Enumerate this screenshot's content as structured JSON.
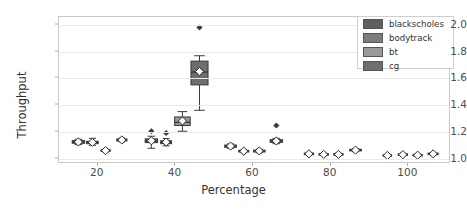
{
  "chart_data": {
    "type": "box",
    "title": "",
    "xlabel": "Percentage",
    "ylabel": "Throughput",
    "xlim": [
      10,
      111
    ],
    "ylim": [
      0.96,
      2.06
    ],
    "xticks": [
      20,
      40,
      60,
      80,
      100
    ],
    "yticks": [
      "1.0",
      "1.2",
      "1.4",
      "1.6",
      "1.8",
      "2.0"
    ],
    "ytick_values": [
      1.0,
      1.2,
      1.4,
      1.6,
      1.8,
      2.0
    ],
    "grid": "horizontal",
    "legend_position": "upper right",
    "legend": [
      {
        "name": "blackscholes",
        "color": "#5f5f5f"
      },
      {
        "name": "bodytrack",
        "color": "#7d7d7d"
      },
      {
        "name": "bt",
        "color": "#9a9a9a"
      },
      {
        "name": "cg",
        "color": "#6e6e6e"
      }
    ],
    "mean_marker": "white-diamond",
    "boxes": [
      {
        "series": "blackscholes",
        "x": 15.0,
        "width": 3.2,
        "q1": 1.115,
        "median": 1.125,
        "q3": 1.135,
        "whisker_low": 1.105,
        "whisker_high": 1.145,
        "mean": 1.125,
        "outliers": []
      },
      {
        "series": "bodytrack",
        "x": 18.6,
        "width": 3.0,
        "q1": 1.112,
        "median": 1.122,
        "q3": 1.13,
        "whisker_low": 1.1,
        "whisker_high": 1.152,
        "mean": 1.122,
        "outliers": []
      },
      {
        "series": "bt",
        "x": 22.0,
        "width": 2.4,
        "q1": 1.055,
        "median": 1.06,
        "q3": 1.066,
        "whisker_low": 1.05,
        "whisker_high": 1.072,
        "mean": 1.06,
        "outliers": []
      },
      {
        "series": "cg",
        "x": 26.2,
        "width": 2.6,
        "q1": 1.132,
        "median": 1.14,
        "q3": 1.148,
        "whisker_low": 1.126,
        "whisker_high": 1.154,
        "mean": 1.14,
        "outliers": []
      },
      {
        "series": "blackscholes",
        "x": 33.8,
        "width": 3.2,
        "q1": 1.12,
        "median": 1.132,
        "q3": 1.148,
        "whisker_low": 1.078,
        "whisker_high": 1.168,
        "mean": 1.134,
        "outliers": [
          1.205
        ]
      },
      {
        "series": "bodytrack",
        "x": 37.6,
        "width": 2.8,
        "q1": 1.112,
        "median": 1.122,
        "q3": 1.134,
        "whisker_low": 1.096,
        "whisker_high": 1.15,
        "mean": 1.124,
        "outliers": [
          1.192
        ]
      },
      {
        "series": "bt",
        "x": 41.8,
        "width": 4.0,
        "q1": 1.248,
        "median": 1.272,
        "q3": 1.312,
        "whisker_low": 1.205,
        "whisker_high": 1.352,
        "mean": 1.282,
        "outliers": []
      },
      {
        "series": "cg",
        "x": 46.2,
        "width": 4.4,
        "q1": 1.552,
        "median": 1.648,
        "q3": 1.73,
        "whisker_low": 1.362,
        "whisker_high": 1.77,
        "mean": 1.652,
        "outliers": [
          1.982
        ]
      },
      {
        "series": "blackscholes",
        "x": 54.2,
        "width": 3.0,
        "q1": 1.085,
        "median": 1.094,
        "q3": 1.102,
        "whisker_low": 1.078,
        "whisker_high": 1.11,
        "mean": 1.094,
        "outliers": []
      },
      {
        "series": "bodytrack",
        "x": 57.6,
        "width": 2.6,
        "q1": 1.05,
        "median": 1.056,
        "q3": 1.062,
        "whisker_low": 1.044,
        "whisker_high": 1.068,
        "mean": 1.056,
        "outliers": []
      },
      {
        "series": "bt",
        "x": 61.6,
        "width": 3.0,
        "q1": 1.05,
        "median": 1.058,
        "q3": 1.064,
        "whisker_low": 1.044,
        "whisker_high": 1.07,
        "mean": 1.058,
        "outliers": []
      },
      {
        "series": "cg",
        "x": 66.0,
        "width": 3.2,
        "q1": 1.122,
        "median": 1.132,
        "q3": 1.142,
        "whisker_low": 1.112,
        "whisker_high": 1.152,
        "mean": 1.132,
        "outliers": [
          1.248
        ]
      },
      {
        "series": "blackscholes",
        "x": 74.4,
        "width": 2.4,
        "q1": 1.03,
        "median": 1.036,
        "q3": 1.042,
        "whisker_low": 1.026,
        "whisker_high": 1.046,
        "mean": 1.036,
        "outliers": []
      },
      {
        "series": "bodytrack",
        "x": 78.2,
        "width": 2.4,
        "q1": 1.026,
        "median": 1.032,
        "q3": 1.038,
        "whisker_low": 1.022,
        "whisker_high": 1.042,
        "mean": 1.032,
        "outliers": []
      },
      {
        "series": "bt",
        "x": 82.0,
        "width": 2.4,
        "q1": 1.026,
        "median": 1.032,
        "q3": 1.038,
        "whisker_low": 1.022,
        "whisker_high": 1.042,
        "mean": 1.032,
        "outliers": []
      },
      {
        "series": "cg",
        "x": 86.4,
        "width": 3.0,
        "q1": 1.058,
        "median": 1.064,
        "q3": 1.07,
        "whisker_low": 1.052,
        "whisker_high": 1.076,
        "mean": 1.064,
        "outliers": []
      },
      {
        "series": "blackscholes",
        "x": 94.6,
        "width": 2.2,
        "q1": 1.018,
        "median": 1.024,
        "q3": 1.029,
        "whisker_low": 1.014,
        "whisker_high": 1.033,
        "mean": 1.024,
        "outliers": []
      },
      {
        "series": "bodytrack",
        "x": 98.6,
        "width": 2.4,
        "q1": 1.024,
        "median": 1.03,
        "q3": 1.036,
        "whisker_low": 1.02,
        "whisker_high": 1.04,
        "mean": 1.03,
        "outliers": []
      },
      {
        "series": "bt",
        "x": 102.4,
        "width": 2.4,
        "q1": 1.02,
        "median": 1.026,
        "q3": 1.032,
        "whisker_low": 1.016,
        "whisker_high": 1.036,
        "mean": 1.026,
        "outliers": []
      },
      {
        "series": "cg",
        "x": 106.4,
        "width": 2.6,
        "q1": 1.03,
        "median": 1.036,
        "q3": 1.042,
        "whisker_low": 1.026,
        "whisker_high": 1.046,
        "mean": 1.036,
        "outliers": []
      }
    ]
  }
}
